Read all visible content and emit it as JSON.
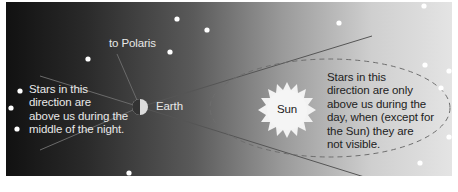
{
  "diagram": {
    "labels": {
      "polaris": "to Polaris",
      "earth": "Earth",
      "sun": "Sun",
      "night_stars": [
        "Stars in this",
        "direction are",
        "above us during the",
        "middle of the night."
      ],
      "day_stars": [
        "Stars in this",
        "direction are only",
        "above us during the",
        "day, when (except for",
        "the Sun) they are",
        "not visible."
      ]
    },
    "colors": {
      "background_left": "#111111",
      "background_right": "#e4e4e4",
      "star": "#ffffff",
      "sun_fill": "#f2f2f2",
      "line": "#6a6a6a",
      "dashed_orbit": "#6e6e6e"
    },
    "stars": [
      {
        "x": 177,
        "y": 19
      },
      {
        "x": 207,
        "y": 30
      },
      {
        "x": 170,
        "y": 52
      },
      {
        "x": 88,
        "y": 59
      },
      {
        "x": 20,
        "y": 91
      },
      {
        "x": 11,
        "y": 108
      },
      {
        "x": 17,
        "y": 129
      },
      {
        "x": 77,
        "y": 180
      },
      {
        "x": 129,
        "y": 173
      },
      {
        "x": 185,
        "y": 183
      },
      {
        "x": 339,
        "y": 23
      },
      {
        "x": 424,
        "y": 6
      },
      {
        "x": 425,
        "y": 65
      },
      {
        "x": 449,
        "y": 71
      },
      {
        "x": 441,
        "y": 88
      },
      {
        "x": 449,
        "y": 137
      },
      {
        "x": 420,
        "y": 163
      },
      {
        "x": 403,
        "y": 182
      }
    ]
  }
}
